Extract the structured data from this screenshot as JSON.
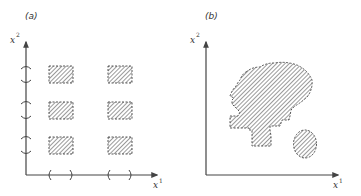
{
  "figure": {
    "panels": [
      {
        "id": "a",
        "label": "(a)",
        "x_axis_label": "x",
        "x_axis_sup": "1",
        "y_axis_label": "x",
        "y_axis_sup": "2",
        "description": "Grid of six hatched rectangular regions formed by products of intervals on each axis",
        "x_intervals": [
          [
            "(",
            ")"
          ],
          [
            "(",
            ")"
          ]
        ],
        "y_intervals": 3,
        "regions": 6
      },
      {
        "id": "b",
        "label": "(b)",
        "x_axis_label": "x",
        "x_axis_sup": "1",
        "y_axis_label": "x",
        "y_axis_sup": "2",
        "description": "Irregular hatched region (blob with stepped lower-left edge) plus a separate small hatched disk",
        "regions": 2
      }
    ],
    "colors": {
      "ink": "#444444",
      "background": "#ffffff"
    }
  }
}
